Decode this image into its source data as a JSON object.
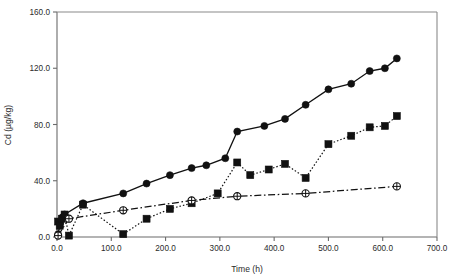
{
  "chart_data": {
    "type": "line",
    "title": "",
    "xlabel": "Time (h)",
    "ylabel": "Cd (µg/kg)",
    "xlim": [
      0.0,
      700.0
    ],
    "ylim": [
      0.0,
      160.0
    ],
    "xticks": [
      "0.0",
      "100.0",
      "200.0",
      "300.0",
      "400.0",
      "500.0",
      "600.0",
      "700.0"
    ],
    "xtick_values": [
      0,
      100,
      200,
      300,
      400,
      500,
      600,
      700
    ],
    "yticks": [
      "0.0",
      "40.0",
      "80.0",
      "120.0",
      "160.0"
    ],
    "ytick_values": [
      0,
      40,
      80,
      120,
      160
    ],
    "grid": false,
    "legend": "none",
    "series": [
      {
        "name": "filled-circle-solid",
        "marker": "filled-circle",
        "linestyle": "solid",
        "color": "#111111",
        "points": [
          [
            2,
            2
          ],
          [
            6,
            10
          ],
          [
            10,
            14
          ],
          [
            14,
            16
          ],
          [
            48,
            24
          ],
          [
            122,
            31
          ],
          [
            165,
            38
          ],
          [
            208,
            44
          ],
          [
            248,
            49
          ],
          [
            275,
            51
          ],
          [
            310,
            56
          ],
          [
            332,
            75
          ],
          [
            382,
            79
          ],
          [
            420,
            84
          ],
          [
            458,
            94
          ],
          [
            500,
            105
          ],
          [
            542,
            109
          ],
          [
            576,
            118
          ],
          [
            604,
            120
          ],
          [
            626,
            127
          ]
        ]
      },
      {
        "name": "filled-square-dotted",
        "marker": "filled-square",
        "linestyle": "dotted",
        "color": "#111111",
        "points": [
          [
            2,
            11
          ],
          [
            5,
            8
          ],
          [
            9,
            13
          ],
          [
            14,
            16
          ],
          [
            22,
            1
          ],
          [
            48,
            23
          ],
          [
            122,
            2
          ],
          [
            165,
            13
          ],
          [
            208,
            20
          ],
          [
            248,
            24
          ],
          [
            296,
            31
          ],
          [
            332,
            53
          ],
          [
            356,
            44
          ],
          [
            390,
            48
          ],
          [
            420,
            52
          ],
          [
            458,
            42
          ],
          [
            500,
            66
          ],
          [
            542,
            72
          ],
          [
            576,
            78
          ],
          [
            604,
            79
          ],
          [
            626,
            86
          ]
        ]
      },
      {
        "name": "open-circle-cross-dashdot",
        "marker": "circle-cross",
        "linestyle": "dashdot",
        "color": "#111111",
        "points": [
          [
            2,
            1
          ],
          [
            22,
            13
          ],
          [
            122,
            19
          ],
          [
            248,
            26
          ],
          [
            332,
            29
          ],
          [
            458,
            31
          ],
          [
            626,
            36
          ]
        ]
      }
    ]
  }
}
